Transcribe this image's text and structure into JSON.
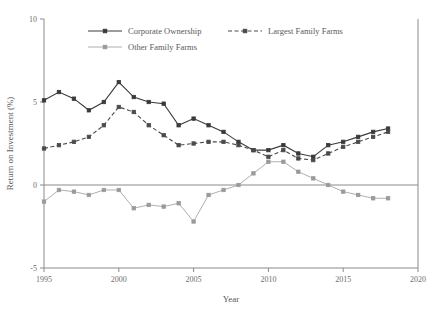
{
  "chart_data": {
    "type": "line",
    "title": "",
    "xlabel": "Year",
    "ylabel": "Return on Investment (%)",
    "xlim": [
      1995,
      2020
    ],
    "ylim": [
      -5,
      10
    ],
    "xticks": [
      1995,
      2000,
      2005,
      2010,
      2015,
      2020
    ],
    "yticks": [
      -5,
      0,
      5,
      10
    ],
    "grid": false,
    "legend_position": "top-center",
    "zero_line": 0,
    "x": [
      1995,
      1996,
      1997,
      1998,
      1999,
      2000,
      2001,
      2002,
      2003,
      2004,
      2005,
      2006,
      2007,
      2008,
      2009,
      2010,
      2011,
      2012,
      2013,
      2014,
      2015,
      2016,
      2017,
      2018
    ],
    "series": [
      {
        "name": "Corporate Ownership",
        "style": "solid",
        "marker": "square",
        "color": "#3a3a3a",
        "values": [
          5.1,
          5.6,
          5.2,
          4.5,
          5.0,
          6.2,
          5.3,
          5.0,
          4.9,
          3.6,
          4.0,
          3.6,
          3.2,
          2.6,
          2.1,
          2.1,
          2.4,
          1.9,
          1.7,
          2.4,
          2.6,
          2.9,
          3.2,
          3.4
        ]
      },
      {
        "name": "Largest Family Farms",
        "style": "dashed",
        "marker": "square",
        "color": "#4a4a4a",
        "values": [
          2.2,
          2.4,
          2.6,
          2.9,
          3.6,
          4.7,
          4.4,
          3.6,
          3.0,
          2.4,
          2.5,
          2.6,
          2.6,
          2.4,
          2.1,
          1.7,
          2.1,
          1.6,
          1.5,
          1.9,
          2.3,
          2.6,
          2.9,
          3.2
        ]
      },
      {
        "name": "Other Family Farms",
        "style": "light",
        "marker": "square",
        "color": "#9a9a9a",
        "values": [
          -1.0,
          -0.3,
          -0.4,
          -0.6,
          -0.3,
          -0.3,
          -1.4,
          -1.2,
          -1.3,
          -1.1,
          -2.2,
          -0.6,
          -0.3,
          0.0,
          0.7,
          1.4,
          1.4,
          0.8,
          0.4,
          0.0,
          -0.4,
          -0.6,
          -0.8,
          -0.8
        ]
      }
    ]
  },
  "legend": {
    "entries": [
      {
        "label": "Corporate Ownership"
      },
      {
        "label": "Largest Family Farms"
      },
      {
        "label": "Other Family Farms"
      }
    ]
  },
  "axes": {
    "x_title": "Year",
    "y_title": "Return on Investment (%)",
    "x_tick_labels": [
      "1995",
      "2000",
      "2005",
      "2010",
      "2015",
      "2020"
    ],
    "y_tick_labels": [
      "10",
      "5",
      "0",
      "-5"
    ]
  }
}
